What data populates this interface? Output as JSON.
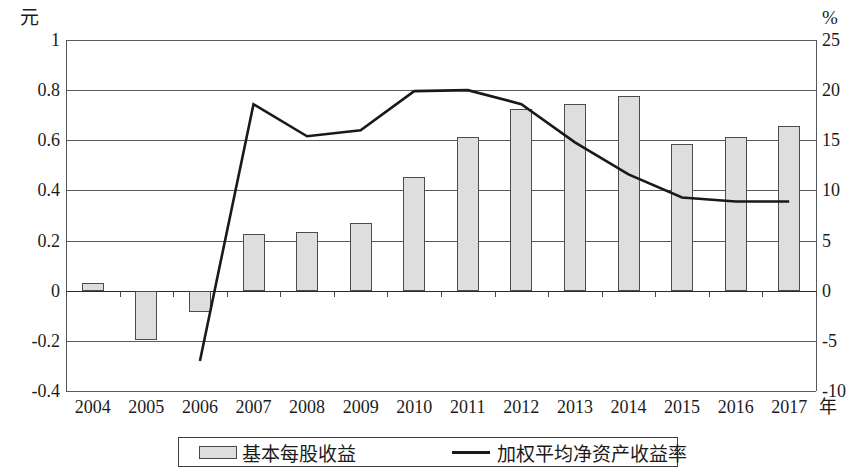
{
  "chart_data": {
    "type": "bar",
    "title": "",
    "xlabel": "年",
    "ylabel": "元",
    "y2label": "%",
    "categories": [
      "2004",
      "2005",
      "2006",
      "2007",
      "2008",
      "2009",
      "2010",
      "2011",
      "2012",
      "2013",
      "2014",
      "2015",
      "2016",
      "2017"
    ],
    "ylim": [
      -0.4,
      1
    ],
    "y2lim": [
      -10,
      25
    ],
    "yticks": [
      "1",
      "0.8",
      "0.6",
      "0.4",
      "0.2",
      "0",
      "-0.2",
      "-0.4"
    ],
    "ytick_values": [
      1,
      0.8,
      0.6,
      0.4,
      0.2,
      0,
      -0.2,
      -0.4
    ],
    "y2ticks": [
      "25",
      "20",
      "15",
      "10",
      "5",
      "0",
      "-5",
      "-10"
    ],
    "y2tick_values": [
      25,
      20,
      15,
      10,
      5,
      0,
      -5,
      -10
    ],
    "grid": true,
    "legend_position": "bottom",
    "series": [
      {
        "name": "基本每股收益",
        "type": "bar",
        "axis": "left",
        "unit": "元",
        "values": [
          0.03,
          -0.195,
          -0.085,
          0.225,
          0.235,
          0.272,
          0.455,
          0.615,
          0.725,
          0.745,
          0.775,
          0.585,
          0.615,
          0.655
        ]
      },
      {
        "name": "加权平均净资产收益率",
        "type": "line",
        "axis": "right",
        "unit": "%",
        "values": [
          null,
          null,
          -7.0,
          18.6,
          15.4,
          16.0,
          19.9,
          20.0,
          18.6,
          14.8,
          11.6,
          9.3,
          8.9,
          8.9
        ]
      }
    ]
  },
  "axes": {
    "left_unit": "元",
    "right_unit": "%",
    "x_name": "年"
  },
  "legend": {
    "items": [
      {
        "label": "基本每股收益",
        "marker": "bar-swatch"
      },
      {
        "label": "加权平均净资产收益率",
        "marker": "line-swatch"
      }
    ]
  },
  "style": {
    "bar_fill": "#dedede",
    "bar_stroke": "#4a4d50",
    "line_color": "#17191b",
    "grid_color": "#555a5e",
    "text_color": "#1b1b1b",
    "background": "#ffffff"
  }
}
